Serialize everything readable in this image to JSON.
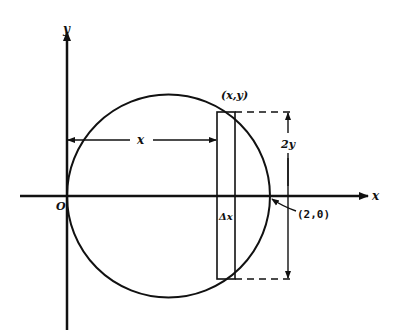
{
  "diagram": {
    "axes": {
      "x_label": "x",
      "y_label": "y",
      "origin_label": "O"
    },
    "circle": {
      "description": "circle through origin with center (1,0), radius 1",
      "point_label": "(2,0)"
    },
    "strip": {
      "top_point_label": "(x,y)",
      "width_label": "Δx",
      "height_label": "2y",
      "distance_label": "x"
    },
    "colors": {
      "stroke": "#111111",
      "background": "#ffffff"
    }
  }
}
